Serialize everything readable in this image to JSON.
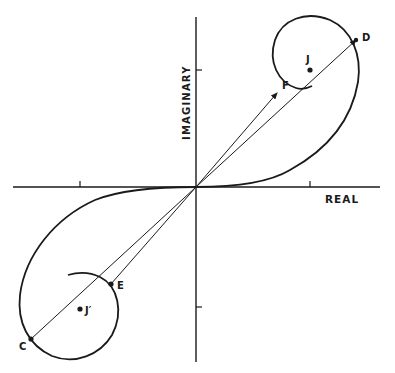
{
  "figure": {
    "type": "complex-plane-diagram",
    "axes": {
      "x_label": "REAL",
      "y_label": "IMAGINARY"
    },
    "points": {
      "D": "D",
      "F": "F",
      "J": "J",
      "C": "C",
      "E": "E",
      "J_prime": "J′"
    },
    "colors": {
      "ink": "#1a1a1a",
      "background": "#ffffff"
    }
  }
}
